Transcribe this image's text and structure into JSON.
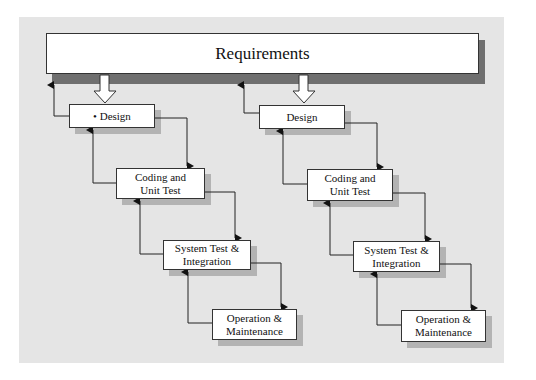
{
  "diagram": {
    "top": {
      "label": "Requirements"
    },
    "columns": [
      {
        "name": "left",
        "stages": [
          {
            "label": "• Design"
          },
          {
            "label": "Coding and\nUnit Test"
          },
          {
            "label": "System Test &\nIntegration"
          },
          {
            "label": "Operation &\nMaintenance"
          }
        ]
      },
      {
        "name": "right",
        "stages": [
          {
            "label": "Design"
          },
          {
            "label": "Coding and\nUnit Test"
          },
          {
            "label": "System Test &\nIntegration"
          },
          {
            "label": "Operation &\nMaintenance"
          }
        ]
      }
    ],
    "colors": {
      "panel": "#e5e5e5",
      "box": "#ffffff",
      "shadow": "#b3b3b3",
      "requirements_shadow": "#6f6f6f",
      "line": "#222222"
    }
  }
}
